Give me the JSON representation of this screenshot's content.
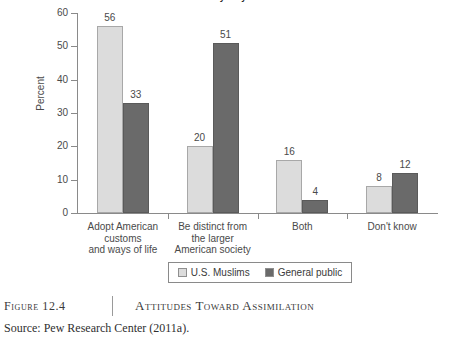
{
  "figure": {
    "number_label": "Figure 12.4",
    "title": "Attitudes Toward Assimilation",
    "source": "Source: Pew Research Center (2011a).",
    "cut_off_title": "Most Muslims who come to the US do say they want to"
  },
  "legend": {
    "items": [
      {
        "label": "U.S. Muslims",
        "color": "#dcdcdc"
      },
      {
        "label": "General public",
        "color": "#6a6a6a"
      }
    ]
  },
  "chart_data": {
    "type": "bar",
    "title": "",
    "xlabel": "",
    "ylabel": "Percent",
    "ylim": [
      0,
      60
    ],
    "yticks": [
      0,
      10,
      20,
      30,
      40,
      50,
      60
    ],
    "ytick_labels": [
      "0",
      "10",
      "20",
      "30",
      "40",
      "50",
      "60"
    ],
    "grid": false,
    "legend_position": "bottom",
    "categories": [
      "Adopt American\ncustoms\nand ways of life",
      "Be distinct from\nthe larger\nAmerican society",
      "Both",
      "Don't know"
    ],
    "series": [
      {
        "name": "U.S. Muslims",
        "color": "#dcdcdc",
        "values": [
          56,
          20,
          16,
          8
        ]
      },
      {
        "name": "General public",
        "color": "#6a6a6a",
        "values": [
          33,
          51,
          4,
          12
        ]
      }
    ]
  }
}
